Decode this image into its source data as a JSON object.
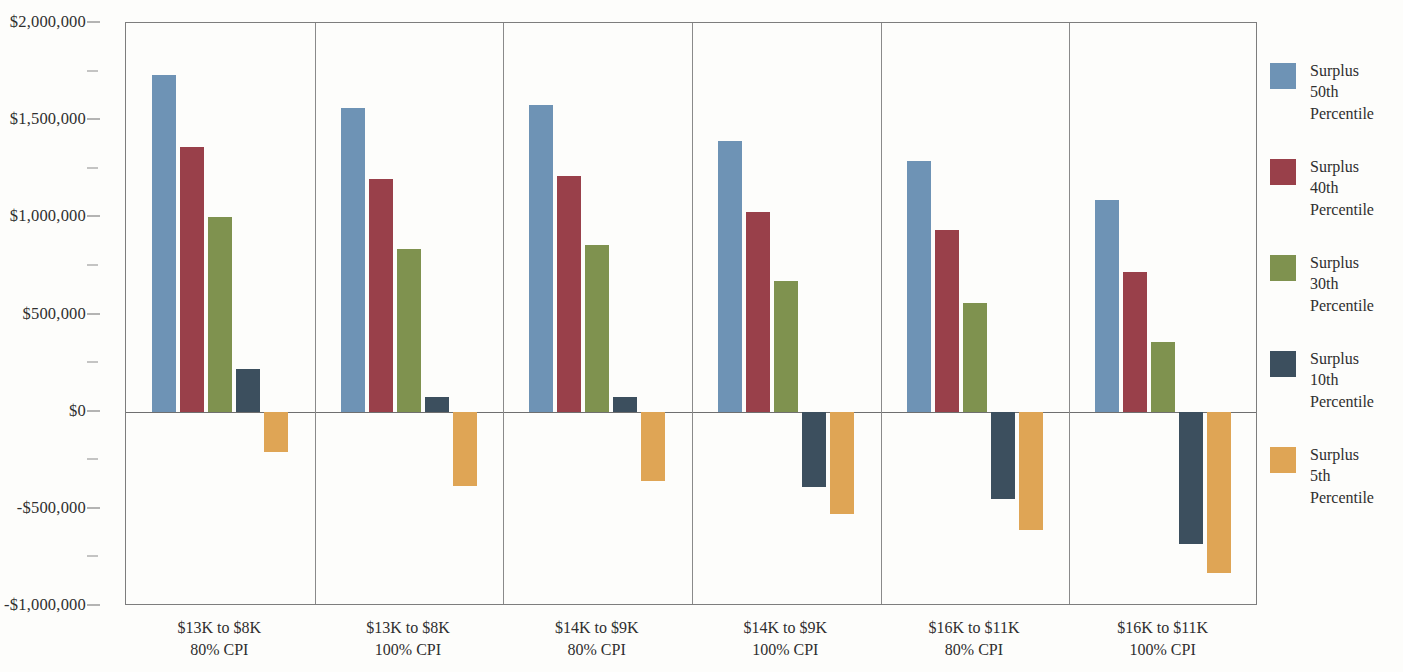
{
  "chart_data": {
    "type": "bar",
    "title": "",
    "subtitle": "",
    "xlabel": "",
    "ylabel": "",
    "ylim": [
      -1000000,
      2000000
    ],
    "grid": false,
    "legend_position": "right",
    "y_tick_labels": [
      "$2,000,000",
      "$1,500,000",
      "$1,000,000",
      "$500,000",
      "$0",
      "-$500,000",
      "-$1,000,000"
    ],
    "y_tick_values": [
      2000000,
      1500000,
      1000000,
      500000,
      0,
      -500000,
      -1000000
    ],
    "y_minor_tick_values": [
      1750000,
      1250000,
      750000,
      250000,
      -250000,
      -750000
    ],
    "categories": [
      "$13K to $8K\n80% CPI",
      "$13K to $8K\n100% CPI",
      "$14K to $9K\n80% CPI",
      "$14K to $9K\n100% CPI",
      "$16K to $11K\n80% CPI",
      "$16K to $11K\n100% CPI"
    ],
    "category_lines": [
      [
        "$13K to $8K",
        "80% CPI"
      ],
      [
        "$13K to $8K",
        "100% CPI"
      ],
      [
        "$14K to $9K",
        "80% CPI"
      ],
      [
        "$14K to $9K",
        "100% CPI"
      ],
      [
        "$16K to $11K",
        "80% CPI"
      ],
      [
        "$16K to $11K",
        "100% CPI"
      ]
    ],
    "series": [
      {
        "name": "Surplus 50th Percentile",
        "name_lines": [
          "Surplus",
          "50th",
          "Percentile"
        ],
        "color": "#6e93b5",
        "values": [
          1730000,
          1565000,
          1580000,
          1395000,
          1290000,
          1090000
        ]
      },
      {
        "name": "Surplus 40th Percentile",
        "name_lines": [
          "Surplus",
          "40th",
          "Percentile"
        ],
        "color": "#99404a",
        "values": [
          1360000,
          1195000,
          1215000,
          1030000,
          935000,
          720000
        ]
      },
      {
        "name": "Surplus 30th Percentile",
        "name_lines": [
          "Surplus",
          "30th",
          "Percentile"
        ],
        "color": "#7f924f",
        "values": [
          1000000,
          835000,
          860000,
          670000,
          560000,
          360000
        ]
      },
      {
        "name": "Surplus 10th Percentile",
        "name_lines": [
          "Surplus",
          "10th",
          "Percentile"
        ],
        "color": "#3c4f5e",
        "values": [
          220000,
          75000,
          75000,
          -390000,
          -450000,
          -680000
        ]
      },
      {
        "name": "Surplus 5th Percentile",
        "name_lines": [
          "Surplus",
          "5th",
          "Percentile"
        ],
        "color": "#dfa555",
        "values": [
          -210000,
          -385000,
          -355000,
          -525000,
          -610000,
          -830000
        ]
      }
    ]
  }
}
